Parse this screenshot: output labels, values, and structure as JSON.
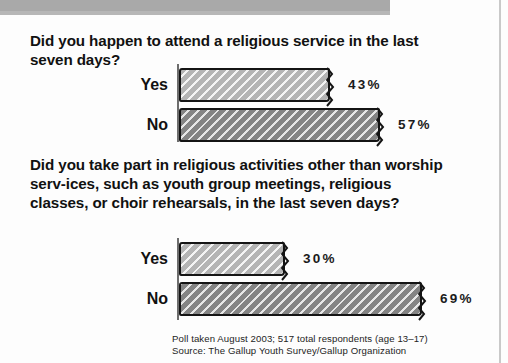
{
  "header": {
    "band_color": "#a9a9a9"
  },
  "questions": {
    "q1": "Did you happen to attend a religious service in the last seven days?",
    "q2": "Did you take part in religious activities other than worship serv-ices, such as youth group meetings, religious classes, or choir rehearsals, in the last seven days?"
  },
  "notes": {
    "line1": "Poll taken August 2003; 517 total respondents (age 13–17)",
    "line2": "Source: The Gallup Youth Survey/Gallup Organization"
  },
  "chart_data": [
    {
      "type": "bar",
      "title": "Did you happen to attend a religious service in the last seven days?",
      "orientation": "horizontal",
      "categories": [
        "Yes",
        "No"
      ],
      "values": [
        43,
        57
      ],
      "value_labels": [
        "43%",
        "57%"
      ],
      "xlabel": "",
      "ylabel": "",
      "xlim": [
        0,
        100
      ],
      "grid": false,
      "legend": "none",
      "bar_colors": [
        "#b4b4b4",
        "#848484"
      ]
    },
    {
      "type": "bar",
      "title": "Did you take part in religious activities other than worship services, such as youth group meetings, religious classes, or choir rehearsals, in the last seven days?",
      "orientation": "horizontal",
      "categories": [
        "Yes",
        "No"
      ],
      "values": [
        30,
        69
      ],
      "value_labels": [
        "30%",
        "69%"
      ],
      "xlabel": "",
      "ylabel": "",
      "xlim": [
        0,
        100
      ],
      "grid": false,
      "legend": "none",
      "bar_colors": [
        "#b4b4b4",
        "#848484"
      ]
    }
  ]
}
